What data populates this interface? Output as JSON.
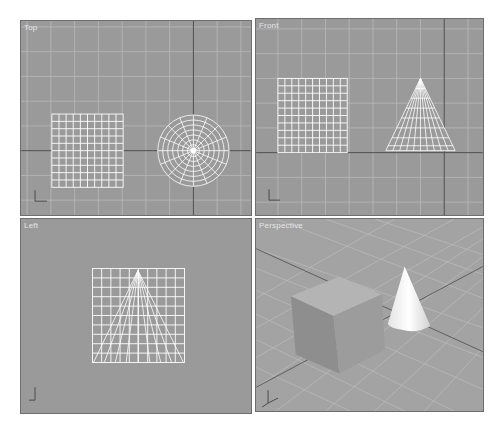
{
  "viewports": [
    {
      "id": "top",
      "label": "Top",
      "objects": [
        "plane-grid",
        "cone-top-view"
      ]
    },
    {
      "id": "front",
      "label": "Front",
      "objects": [
        "plane-grid",
        "cone-side-view"
      ]
    },
    {
      "id": "left",
      "label": "Left",
      "objects": [
        "plane-grid-with-cone-overlay"
      ]
    },
    {
      "id": "perspective",
      "label": "Perspective",
      "objects": [
        "box-shaded",
        "cone-shaded"
      ]
    }
  ],
  "colors": {
    "viewport_bg": "#9a9a9a",
    "grid_line": "#b8b8b8",
    "axis_line": "#4a4a4a",
    "wireframe": "#ffffff",
    "box_face_top": "#b2b2b2",
    "box_face_front": "#8e8e8e",
    "box_face_side": "#9d9d9d",
    "cone": "#f2f2f2"
  }
}
